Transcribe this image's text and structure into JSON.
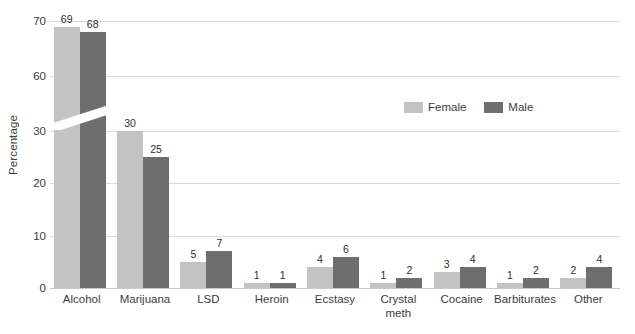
{
  "chart_data": {
    "type": "bar",
    "title": "",
    "xlabel": "",
    "ylabel": "Percentage",
    "categories": [
      "Alcohol",
      "Marijuana",
      "LSD",
      "Heroin",
      "Ecstasy",
      "Crystal meth",
      "Cocaine",
      "Barbiturates",
      "Other"
    ],
    "series": [
      {
        "name": "Female",
        "color": "#c3c3c3",
        "values": [
          69,
          30,
          5,
          1,
          4,
          1,
          3,
          1,
          2
        ]
      },
      {
        "name": "Male",
        "color": "#6e6e6e",
        "values": [
          68,
          25,
          7,
          1,
          6,
          2,
          4,
          2,
          4
        ]
      }
    ],
    "ylim": [
      0,
      70
    ],
    "yticks": [
      0,
      10,
      20,
      30,
      60,
      70
    ],
    "ytick_labels": [
      "0",
      "10",
      "20",
      "30",
      "60",
      "70"
    ],
    "axis_break": {
      "present": true,
      "from": 30,
      "to": 60
    },
    "grid": true,
    "legend_position": "upper-right-inside",
    "data_labels": true
  },
  "axis": {
    "y_title": "Percentage"
  },
  "legend": {
    "items": [
      {
        "label": "Female"
      },
      {
        "label": "Male"
      }
    ]
  },
  "colors": {
    "female": "#c3c3c3",
    "male": "#6e6e6e",
    "gridline": "#d9d9d9",
    "text": "#3b3b3b",
    "background": "#ffffff"
  }
}
